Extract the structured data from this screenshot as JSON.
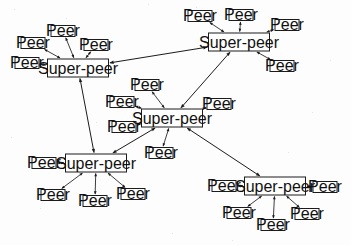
{
  "figure": {
    "kind": "network-diagram",
    "background_color": "#fdfdfd",
    "node_fill": "#ffffff",
    "stroke_color": "#1b1b1b",
    "width": 351,
    "height": 245
  },
  "labels": {
    "superpeer": "Super-peer",
    "peer": "Peer"
  },
  "superpeers": [
    {
      "id": "sp-top-left",
      "label": "Super-peer",
      "x": 78,
      "y": 68,
      "w": 62,
      "h": 19
    },
    {
      "id": "sp-top-right",
      "label": "Super-peer",
      "x": 239,
      "y": 42,
      "w": 62,
      "h": 19
    },
    {
      "id": "sp-center",
      "label": "Super-peer",
      "x": 172,
      "y": 118,
      "w": 62,
      "h": 19
    },
    {
      "id": "sp-bottom-left",
      "label": "Super-peer",
      "x": 96,
      "y": 163,
      "w": 62,
      "h": 19
    },
    {
      "id": "sp-bottom-right",
      "label": "Super-peer",
      "x": 275,
      "y": 186,
      "w": 62,
      "h": 19
    }
  ],
  "peers": [
    {
      "id": "p-tl-1",
      "label": "Peer",
      "x": 63,
      "y": 31,
      "w": 25,
      "h": 12,
      "parent": "sp-top-left"
    },
    {
      "id": "p-tl-2",
      "label": "Peer",
      "x": 33,
      "y": 43,
      "w": 25,
      "h": 12,
      "parent": "sp-top-left"
    },
    {
      "id": "p-tl-3",
      "label": "Peer",
      "x": 27,
      "y": 63,
      "w": 25,
      "h": 12,
      "parent": "sp-top-left"
    },
    {
      "id": "p-tl-4",
      "label": "Peer",
      "x": 96,
      "y": 45,
      "w": 25,
      "h": 12,
      "parent": "sp-top-left"
    },
    {
      "id": "p-tr-1",
      "label": "Peer",
      "x": 200,
      "y": 16,
      "w": 25,
      "h": 12,
      "parent": "sp-top-right"
    },
    {
      "id": "p-tr-2",
      "label": "Peer",
      "x": 241,
      "y": 15,
      "w": 25,
      "h": 12,
      "parent": "sp-top-right"
    },
    {
      "id": "p-tr-3",
      "label": "Peer",
      "x": 287,
      "y": 25,
      "w": 25,
      "h": 12,
      "parent": "sp-top-right"
    },
    {
      "id": "p-tr-4",
      "label": "Peer",
      "x": 282,
      "y": 66,
      "w": 25,
      "h": 12,
      "parent": "sp-top-right"
    },
    {
      "id": "p-c-1",
      "label": "Peer",
      "x": 147,
      "y": 85,
      "w": 25,
      "h": 12,
      "parent": "sp-center"
    },
    {
      "id": "p-c-2",
      "label": "Peer",
      "x": 122,
      "y": 102,
      "w": 25,
      "h": 12,
      "parent": "sp-center"
    },
    {
      "id": "p-c-3",
      "label": "Peer",
      "x": 124,
      "y": 127,
      "w": 25,
      "h": 12,
      "parent": "sp-center"
    },
    {
      "id": "p-c-4",
      "label": "Peer",
      "x": 219,
      "y": 104,
      "w": 25,
      "h": 12,
      "parent": "sp-center"
    },
    {
      "id": "p-c-5",
      "label": "Peer",
      "x": 161,
      "y": 153,
      "w": 25,
      "h": 12,
      "parent": "sp-center"
    },
    {
      "id": "p-bl-1",
      "label": "Peer",
      "x": 44,
      "y": 163,
      "w": 25,
      "h": 12,
      "parent": "sp-bottom-left"
    },
    {
      "id": "p-bl-2",
      "label": "Peer",
      "x": 53,
      "y": 195,
      "w": 25,
      "h": 12,
      "parent": "sp-bottom-left"
    },
    {
      "id": "p-bl-3",
      "label": "Peer",
      "x": 95,
      "y": 201,
      "w": 25,
      "h": 12,
      "parent": "sp-bottom-left"
    },
    {
      "id": "p-bl-4",
      "label": "Peer",
      "x": 133,
      "y": 194,
      "w": 25,
      "h": 12,
      "parent": "sp-bottom-left"
    },
    {
      "id": "p-br-1",
      "label": "Peer",
      "x": 224,
      "y": 186,
      "w": 25,
      "h": 12,
      "parent": "sp-bottom-right"
    },
    {
      "id": "p-br-2",
      "label": "Peer",
      "x": 325,
      "y": 187,
      "w": 25,
      "h": 12,
      "parent": "sp-bottom-right"
    },
    {
      "id": "p-br-3",
      "label": "Peer",
      "x": 239,
      "y": 213,
      "w": 25,
      "h": 12,
      "parent": "sp-bottom-right"
    },
    {
      "id": "p-br-4",
      "label": "Peer",
      "x": 273,
      "y": 225,
      "w": 25,
      "h": 12,
      "parent": "sp-bottom-right"
    },
    {
      "id": "p-br-5",
      "label": "Peer",
      "x": 307,
      "y": 214,
      "w": 25,
      "h": 12,
      "parent": "sp-bottom-right"
    }
  ],
  "overlay_links": [
    {
      "from": "sp-top-left",
      "to": "sp-top-right",
      "arrows": "both"
    },
    {
      "from": "sp-top-left",
      "to": "sp-bottom-left",
      "arrows": "both"
    },
    {
      "from": "sp-center",
      "to": "sp-top-right",
      "arrows": "both"
    },
    {
      "from": "sp-center",
      "to": "sp-bottom-left",
      "arrows": "both"
    },
    {
      "from": "sp-center",
      "to": "sp-bottom-right",
      "arrows": "both"
    }
  ],
  "access_links": [
    {
      "from": "p-tl-1",
      "to": "sp-top-left",
      "arrows": "both"
    },
    {
      "from": "p-tl-2",
      "to": "sp-top-left",
      "arrows": "both"
    },
    {
      "from": "p-tl-3",
      "to": "sp-top-left",
      "arrows": "both"
    },
    {
      "from": "p-tl-4",
      "to": "sp-top-left",
      "arrows": "both"
    },
    {
      "from": "p-tr-1",
      "to": "sp-top-right",
      "arrows": "both"
    },
    {
      "from": "p-tr-2",
      "to": "sp-top-right",
      "arrows": "both"
    },
    {
      "from": "p-tr-3",
      "to": "sp-top-right",
      "arrows": "both"
    },
    {
      "from": "p-tr-4",
      "to": "sp-top-right",
      "arrows": "both"
    },
    {
      "from": "p-c-1",
      "to": "sp-center",
      "arrows": "both"
    },
    {
      "from": "p-c-2",
      "to": "sp-center",
      "arrows": "both"
    },
    {
      "from": "p-c-3",
      "to": "sp-center",
      "arrows": "both"
    },
    {
      "from": "p-c-4",
      "to": "sp-center",
      "arrows": "both"
    },
    {
      "from": "p-c-5",
      "to": "sp-center",
      "arrows": "both"
    },
    {
      "from": "p-bl-1",
      "to": "sp-bottom-left",
      "arrows": "both"
    },
    {
      "from": "p-bl-2",
      "to": "sp-bottom-left",
      "arrows": "both"
    },
    {
      "from": "p-bl-3",
      "to": "sp-bottom-left",
      "arrows": "both"
    },
    {
      "from": "p-bl-4",
      "to": "sp-bottom-left",
      "arrows": "both"
    },
    {
      "from": "p-br-1",
      "to": "sp-bottom-right",
      "arrows": "both"
    },
    {
      "from": "p-br-2",
      "to": "sp-bottom-right",
      "arrows": "both"
    },
    {
      "from": "p-br-3",
      "to": "sp-bottom-right",
      "arrows": "both"
    },
    {
      "from": "p-br-4",
      "to": "sp-bottom-right",
      "arrows": "both"
    },
    {
      "from": "p-br-5",
      "to": "sp-bottom-right",
      "arrows": "both"
    }
  ]
}
